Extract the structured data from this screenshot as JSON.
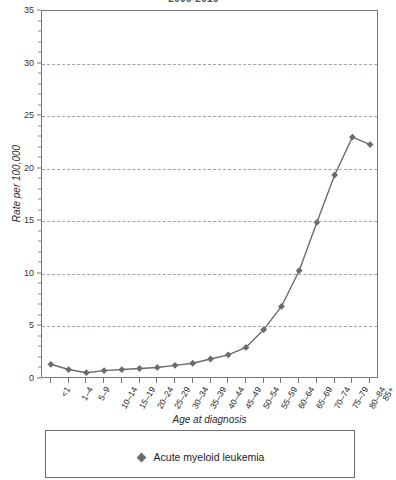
{
  "chart_data": {
    "type": "line",
    "title": "2006-2010",
    "xlabel": "Age at diagnosis",
    "ylabel": "Rate per 100,000",
    "ylim": [
      0,
      35
    ],
    "ytick_step": 5,
    "yticks": [
      0,
      5,
      10,
      15,
      20,
      25,
      30,
      35
    ],
    "ytick_labels": [
      "0",
      "5",
      "10",
      "15",
      "20",
      "25",
      "30",
      "35"
    ],
    "grid": "horizontal-dashed",
    "legend_position": "bottom",
    "categories": [
      "<1",
      "1–4",
      "5–9",
      "10–14",
      "15–19",
      "20–24",
      "25–29",
      "30–34",
      "35–39",
      "40–44",
      "45–49",
      "50–54",
      "55–59",
      "60–64",
      "65–69",
      "70–74",
      "75–79",
      "80–84",
      "85+"
    ],
    "series": [
      {
        "name": "Acute myeloid leukemia",
        "color": "#6b6b6b",
        "marker": "diamond",
        "values": [
          1.4,
          0.9,
          0.6,
          0.8,
          0.9,
          1.0,
          1.1,
          1.3,
          1.5,
          1.9,
          2.3,
          3.0,
          4.7,
          6.9,
          10.3,
          14.9,
          19.4,
          23.0,
          22.3
        ]
      }
    ]
  },
  "legend": {
    "entries": [
      {
        "label": "Acute myeloid leukemia",
        "marker": "diamond-marker-icon"
      }
    ]
  }
}
